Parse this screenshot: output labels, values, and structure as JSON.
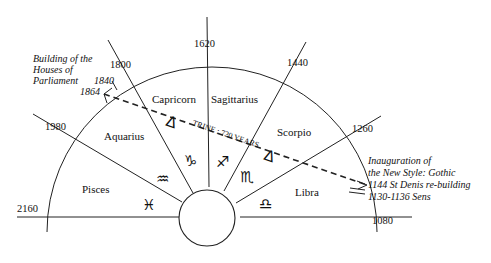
{
  "diagram": {
    "center": {
      "x": 212,
      "y": 215,
      "r": 28
    },
    "outer_radius": 165,
    "year_markers": [
      {
        "label": "2160",
        "angle_deg": 180
      },
      {
        "label": "1980",
        "angle_deg": 150
      },
      {
        "label": "1800",
        "angle_deg": 120
      },
      {
        "label": "1620",
        "angle_deg": 90
      },
      {
        "label": "1440",
        "angle_deg": 60
      },
      {
        "label": "1260",
        "angle_deg": 30
      },
      {
        "label": "1080",
        "angle_deg": 0
      }
    ],
    "signs": [
      {
        "name": "Pisces",
        "glyph": "♓"
      },
      {
        "name": "Aquarius",
        "glyph": "♒"
      },
      {
        "name": "Capricorn",
        "glyph": "♑"
      },
      {
        "name": "Sagittarius",
        "glyph": "♐"
      },
      {
        "name": "Scorpio",
        "glyph": "♏"
      },
      {
        "name": "Libra",
        "glyph": "♎"
      }
    ],
    "trine": {
      "label": "TRINE : 720 YEARS",
      "aspect_glyph": "Δ",
      "from_year": "1864",
      "to_year": "1144"
    },
    "annotations": {
      "left": {
        "lines": [
          "Building of the",
          "Houses of",
          "Parliament"
        ],
        "years": [
          "1840",
          "1864"
        ]
      },
      "right": {
        "lines": [
          "Inauguration of",
          "the New Style: Gothic",
          "1144 St Denis re-building",
          "1130-1136 Sens"
        ]
      }
    }
  }
}
